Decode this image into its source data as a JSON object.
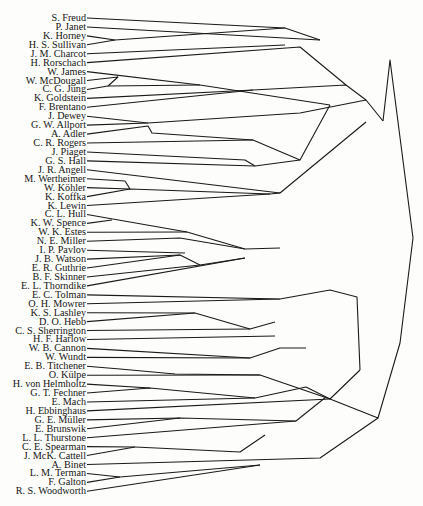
{
  "diagram": {
    "type": "dendrogram",
    "leaves": [
      "S. Freud",
      "P. Janet",
      "K. Horney",
      "H. S. Sullivan",
      "J. M. Charcot",
      "H. Rorschach",
      "W. James",
      "W. McDougall",
      "C. G. Jung",
      "K. Goldstein",
      "F. Brentano",
      "J. Dewey",
      "G. W. Allport",
      "A. Adler",
      "C. R. Rogers",
      "J. Piaget",
      "G. S. Hall",
      "J. R. Angell",
      "M. Wertheimer",
      "W. Köhler",
      "K. Koffka",
      "K. Lewin",
      "C. L. Hull",
      "K. W. Spence",
      "W. K. Estes",
      "N. E. Miller",
      "I. P. Pavlov",
      "J. B. Watson",
      "E. R. Guthrie",
      "B. F. Skinner",
      "E. L. Thorndike",
      "E. C. Tolman",
      "O. H. Mowrer",
      "K. S. Lashley",
      "D. O. Hebb",
      "C. S. Sherrington",
      "H. F. Harlow",
      "W. B. Cannon",
      "W. Wundt",
      "E. B. Titchener",
      "O. Külpe",
      "H. von Helmholtz",
      "G. T. Fechner",
      "E. Mach",
      "H. Ebbinghaus",
      "G. E. Müller",
      "E. Brunswik",
      "L. L. Thurstone",
      "C. E. Spearman",
      "J. McK. Cattell",
      "A. Binet",
      "L. M. Terman",
      "F. Galton",
      "R. S. Woodworth"
    ],
    "top_y": 18,
    "row_step": 8.93,
    "segments": [
      [
        [
          87,
          18
        ],
        [
          285,
          28
        ],
        [
          320,
          40
        ]
      ],
      [
        [
          87,
          27
        ],
        [
          320,
          40
        ]
      ],
      [
        [
          87,
          36
        ],
        [
          115,
          40
        ],
        [
          200,
          34
        ],
        [
          285,
          28
        ]
      ],
      [
        [
          87,
          45
        ],
        [
          115,
          40
        ]
      ],
      [
        [
          87,
          54
        ],
        [
          285,
          45
        ]
      ],
      [
        [
          87,
          63
        ],
        [
          300,
          47
        ],
        [
          346,
          85
        ]
      ],
      [
        [
          87,
          72
        ],
        [
          200,
          85
        ],
        [
          330,
          105
        ]
      ],
      [
        [
          87,
          81
        ],
        [
          118,
          77
        ],
        [
          108,
          86
        ]
      ],
      [
        [
          87,
          90
        ],
        [
          108,
          86
        ],
        [
          200,
          85
        ]
      ],
      [
        [
          87,
          99
        ],
        [
          253,
          90
        ]
      ],
      [
        [
          87,
          108
        ],
        [
          253,
          90
        ],
        [
          346,
          85
        ],
        [
          366,
          100
        ]
      ],
      [
        [
          87,
          117
        ],
        [
          148,
          123
        ]
      ],
      [
        [
          87,
          126
        ],
        [
          148,
          123
        ],
        [
          300,
          113
        ],
        [
          366,
          100
        ],
        [
          383,
          121
        ]
      ],
      [
        [
          87,
          135
        ],
        [
          148,
          126
        ],
        [
          152,
          133
        ],
        [
          253,
          140
        ],
        [
          300,
          160
        ],
        [
          330,
          105
        ]
      ],
      [
        [
          87,
          144
        ],
        [
          253,
          140
        ]
      ],
      [
        [
          87,
          153
        ],
        [
          245,
          160
        ],
        [
          255,
          166
        ]
      ],
      [
        [
          87,
          162
        ],
        [
          255,
          166
        ],
        [
          300,
          160
        ]
      ],
      [
        [
          87,
          171
        ],
        [
          280,
          193
        ],
        [
          366,
          122
        ]
      ],
      [
        [
          87,
          180
        ],
        [
          125,
          181
        ],
        [
          130,
          189
        ]
      ],
      [
        [
          87,
          189
        ],
        [
          130,
          189
        ]
      ],
      [
        [
          87,
          198
        ],
        [
          130,
          189
        ],
        [
          270,
          194
        ],
        [
          280,
          193
        ]
      ],
      [
        [
          87,
          207
        ],
        [
          270,
          194
        ]
      ],
      [
        [
          87,
          216
        ],
        [
          187,
          232
        ],
        [
          245,
          249
        ],
        [
          280,
          248
        ]
      ],
      [
        [
          87,
          225
        ],
        [
          112,
          220
        ]
      ],
      [
        [
          87,
          234
        ],
        [
          187,
          232
        ]
      ],
      [
        [
          87,
          243
        ],
        [
          180,
          238
        ],
        [
          245,
          249
        ]
      ],
      [
        [
          87,
          252
        ],
        [
          185,
          253
        ]
      ],
      [
        [
          87,
          261
        ],
        [
          180,
          255
        ],
        [
          200,
          265
        ],
        [
          245,
          258
        ]
      ],
      [
        [
          87,
          270
        ],
        [
          180,
          255
        ]
      ],
      [
        [
          87,
          279
        ],
        [
          200,
          265
        ]
      ],
      [
        [
          87,
          288
        ],
        [
          245,
          258
        ]
      ],
      [
        [
          87,
          297
        ],
        [
          280,
          299
        ]
      ],
      [
        [
          87,
          306
        ],
        [
          280,
          299
        ],
        [
          330,
          290
        ],
        [
          357,
          297
        ],
        [
          360,
          370
        ]
      ],
      [
        [
          87,
          315
        ],
        [
          195,
          313
        ],
        [
          250,
          329
        ],
        [
          275,
          322
        ]
      ],
      [
        [
          87,
          324
        ],
        [
          195,
          313
        ]
      ],
      [
        [
          87,
          333
        ],
        [
          250,
          329
        ]
      ],
      [
        [
          87,
          342
        ],
        [
          275,
          336
        ]
      ],
      [
        [
          87,
          351
        ],
        [
          250,
          358
        ],
        [
          280,
          348
        ],
        [
          306,
          348
        ]
      ],
      [
        [
          87,
          360
        ],
        [
          250,
          358
        ]
      ],
      [
        [
          87,
          369
        ],
        [
          120,
          369
        ],
        [
          175,
          374
        ],
        [
          260,
          375
        ],
        [
          330,
          399
        ],
        [
          360,
          370
        ]
      ],
      [
        [
          87,
          378
        ],
        [
          260,
          375
        ]
      ],
      [
        [
          87,
          387
        ],
        [
          150,
          388
        ]
      ],
      [
        [
          87,
          396
        ],
        [
          150,
          388
        ],
        [
          255,
          398
        ],
        [
          306,
          387
        ],
        [
          330,
          399
        ],
        [
          378,
          418
        ],
        [
          400,
          343
        ],
        [
          413,
          238
        ],
        [
          390,
          60
        ],
        [
          383,
          121
        ]
      ],
      [
        [
          87,
          405
        ],
        [
          255,
          398
        ]
      ],
      [
        [
          87,
          414
        ],
        [
          330,
          399
        ]
      ],
      [
        [
          87,
          423
        ],
        [
          180,
          418
        ],
        [
          296,
          421
        ]
      ],
      [
        [
          87,
          432
        ],
        [
          180,
          418
        ]
      ],
      [
        [
          87,
          441
        ],
        [
          296,
          421
        ],
        [
          326,
          397
        ]
      ],
      [
        [
          87,
          450
        ],
        [
          135,
          447
        ],
        [
          240,
          452
        ],
        [
          265,
          435
        ]
      ],
      [
        [
          87,
          459
        ],
        [
          135,
          447
        ]
      ],
      [
        [
          87,
          468
        ],
        [
          320,
          458
        ],
        [
          378,
          418
        ]
      ],
      [
        [
          87,
          477
        ],
        [
          120,
          477
        ],
        [
          260,
          465
        ]
      ],
      [
        [
          87,
          486
        ],
        [
          120,
          477
        ]
      ],
      [
        [
          87,
          495
        ],
        [
          260,
          465
        ]
      ]
    ]
  }
}
